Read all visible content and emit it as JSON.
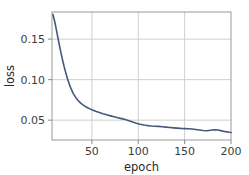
{
  "figure": {
    "background_color": "#ffffff",
    "plot_area": {
      "left": 52,
      "top": 12,
      "right": 231,
      "bottom": 140,
      "frame_color": "#9a9a9a",
      "grid_color": "#c9c9c9",
      "grid_enabled": true
    }
  },
  "chart_data": {
    "type": "line",
    "title": "",
    "subtitle": "",
    "xlabel": "epoch",
    "ylabel": "loss",
    "xlim": [
      7,
      200
    ],
    "ylim": [
      0.0255,
      0.1835
    ],
    "xticks": [
      50,
      100,
      150,
      200
    ],
    "xticklabels": [
      "50",
      "100",
      "150",
      "200"
    ],
    "yticks": [
      0.05,
      0.1,
      0.15
    ],
    "yticklabels": [
      "0.05",
      "0.10",
      "0.15"
    ],
    "grid": true,
    "legend": null,
    "legend_position": "none",
    "line_color": "#48587a",
    "line_width": 1.6,
    "series": [
      {
        "name": "loss",
        "x": [
          8,
          10,
          12,
          14,
          16,
          18,
          20,
          22,
          24,
          26,
          28,
          30,
          32,
          34,
          36,
          38,
          40,
          42,
          44,
          46,
          48,
          50,
          54,
          58,
          62,
          66,
          70,
          74,
          78,
          82,
          86,
          90,
          94,
          98,
          102,
          106,
          110,
          114,
          118,
          122,
          126,
          130,
          134,
          138,
          142,
          146,
          150,
          154,
          158,
          162,
          166,
          170,
          174,
          178,
          182,
          186,
          190,
          194,
          198,
          200
        ],
        "y": [
          0.1805,
          0.1715,
          0.16,
          0.148,
          0.1368,
          0.1262,
          0.1165,
          0.1078,
          0.1,
          0.0932,
          0.0876,
          0.0828,
          0.079,
          0.0758,
          0.0732,
          0.071,
          0.0692,
          0.0676,
          0.0662,
          0.065,
          0.0639,
          0.0629,
          0.061,
          0.0594,
          0.0579,
          0.0566,
          0.0553,
          0.0541,
          0.053,
          0.0519,
          0.0507,
          0.0493,
          0.0478,
          0.0463,
          0.045,
          0.044,
          0.0433,
          0.0428,
          0.0425,
          0.0423,
          0.0419,
          0.0414,
          0.0409,
          0.0405,
          0.0401,
          0.0398,
          0.0396,
          0.0393,
          0.039,
          0.0385,
          0.0379,
          0.0373,
          0.037,
          0.0376,
          0.0382,
          0.0378,
          0.0368,
          0.0358,
          0.035,
          0.0347
        ]
      }
    ]
  }
}
